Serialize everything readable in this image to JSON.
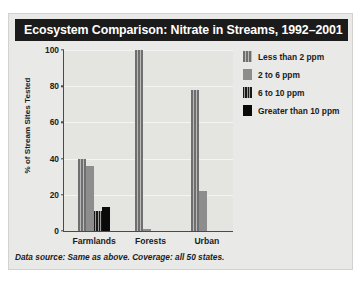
{
  "card": {
    "title": "Ecosystem Comparison: Nitrate in Streams, 1992–2001",
    "footnote": "Data source: Same as above. Coverage: all 50 states."
  },
  "chart_data": {
    "type": "bar",
    "title": "Ecosystem Comparison: Nitrate in Streams, 1992–2001",
    "xlabel": "",
    "ylabel": "% of Stream Sites Tested",
    "categories": [
      "Farmlands",
      "Forests",
      "Urban"
    ],
    "yticks": [
      0,
      20,
      40,
      60,
      80,
      100
    ],
    "ylim": [
      0,
      100
    ],
    "grid": true,
    "legend_position": "top-right",
    "series": [
      {
        "name": "Less than 2 ppm",
        "color": "#6f6f6f",
        "pattern": "vertical-stripes-light",
        "values": [
          40,
          100,
          78
        ]
      },
      {
        "name": "2 to 6 ppm",
        "color": "#8d8d8d",
        "pattern": "solid",
        "values": [
          36,
          1,
          22
        ]
      },
      {
        "name": "6 to 10 ppm",
        "color": "#191919",
        "pattern": "vertical-stripes-dark",
        "values": [
          11,
          0,
          0
        ]
      },
      {
        "name": "Greater than 10 ppm",
        "color": "#0a0a0a",
        "pattern": "solid",
        "values": [
          13,
          0,
          0
        ]
      }
    ]
  }
}
